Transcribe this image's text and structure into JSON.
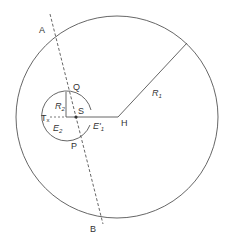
{
  "diagram": {
    "colors": {
      "stroke": "#555555",
      "text": "#333333",
      "background": "#ffffff"
    },
    "outer_circle": {
      "cx": 117,
      "cy": 117,
      "r": 101
    },
    "small_circle": {
      "cx": 66,
      "cy": 117,
      "r": 25
    },
    "labels": {
      "A": "A",
      "B": "B",
      "Q": "Q",
      "P": "P",
      "S": "S",
      "H": "H",
      "T": "T",
      "T_sub": "x",
      "R1": "R",
      "R1_sub": "1",
      "R2": "R",
      "R2_sub": "2",
      "E2": "E",
      "E2_sub": "2",
      "E1": "E'",
      "E1_sub": "1"
    }
  }
}
